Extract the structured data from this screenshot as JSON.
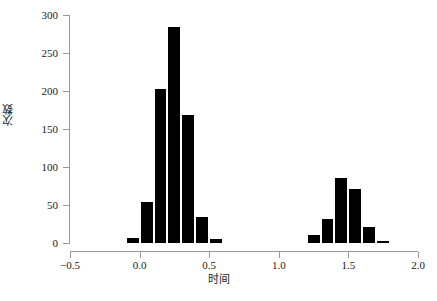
{
  "chart_data": {
    "type": "bar",
    "subtype": "histogram",
    "title": "",
    "xlabel": "时间",
    "ylabel": "次数",
    "xlim": [
      -0.5,
      2.0
    ],
    "ylim": [
      0,
      300
    ],
    "xticks": [
      -0.5,
      0.0,
      0.5,
      1.0,
      1.5,
      2.0
    ],
    "xtick_labels": [
      "−0.5",
      "0.0",
      "0.5",
      "1.0",
      "1.5",
      "2.0"
    ],
    "yticks": [
      0,
      50,
      100,
      150,
      200,
      250,
      300
    ],
    "ytick_labels": [
      "0",
      "50",
      "100",
      "150",
      "200",
      "250",
      "300"
    ],
    "grid": false,
    "legend": null,
    "bin_width": 0.1,
    "bar_color": "#000000",
    "bin_edges": [
      -0.1,
      0.0,
      0.1,
      0.2,
      0.3,
      0.4,
      0.5,
      0.6
    ],
    "bin_edges_right": [
      1.2,
      1.3,
      1.4,
      1.5,
      1.6,
      1.7,
      1.8
    ],
    "bars": [
      {
        "x0": -0.1,
        "x1": 0.0,
        "value": 6
      },
      {
        "x0": 0.0,
        "x1": 0.1,
        "value": 54
      },
      {
        "x0": 0.1,
        "x1": 0.2,
        "value": 202
      },
      {
        "x0": 0.2,
        "x1": 0.3,
        "value": 284
      },
      {
        "x0": 0.3,
        "x1": 0.4,
        "value": 169
      },
      {
        "x0": 0.4,
        "x1": 0.5,
        "value": 34
      },
      {
        "x0": 0.5,
        "x1": 0.6,
        "value": 5
      },
      {
        "x0": 1.2,
        "x1": 1.3,
        "value": 11
      },
      {
        "x0": 1.3,
        "x1": 1.4,
        "value": 32
      },
      {
        "x0": 1.4,
        "x1": 1.5,
        "value": 85
      },
      {
        "x0": 1.5,
        "x1": 1.6,
        "value": 71
      },
      {
        "x0": 1.6,
        "x1": 1.7,
        "value": 21
      },
      {
        "x0": 1.7,
        "x1": 1.8,
        "value": 3
      }
    ],
    "categories": [
      "-0.1",
      "0.0",
      "0.1",
      "0.2",
      "0.3",
      "0.4",
      "0.5",
      "1.2",
      "1.3",
      "1.4",
      "1.5",
      "1.6",
      "1.7"
    ],
    "values": [
      6,
      54,
      202,
      284,
      169,
      34,
      5,
      11,
      32,
      85,
      71,
      21,
      3
    ]
  }
}
